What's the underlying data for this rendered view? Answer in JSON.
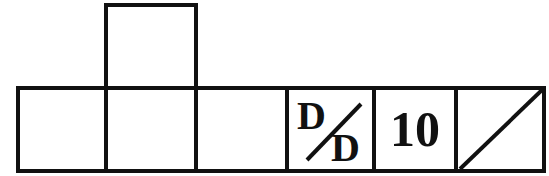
{
  "figure": {
    "top_box": {
      "label": ""
    },
    "row": [
      {
        "label": ""
      },
      {
        "label": ""
      },
      {
        "label": ""
      },
      {
        "label_top": "D",
        "label_bottom": "D",
        "type": "fraction-diagonal"
      },
      {
        "label": "10"
      },
      {
        "label": "",
        "type": "diagonal-line"
      }
    ],
    "line_color": "#111111"
  }
}
